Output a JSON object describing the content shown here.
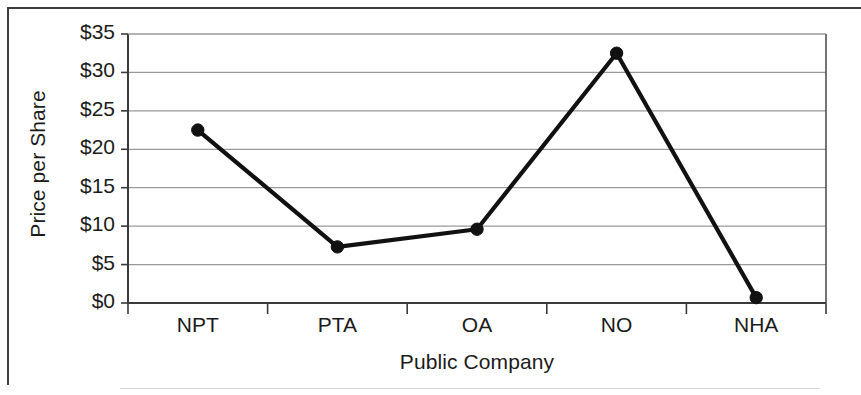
{
  "chart_data": {
    "type": "line",
    "title": "",
    "xlabel": "Public Company",
    "ylabel": "Price per Share",
    "categories": [
      "NPT",
      "PTA",
      "OA",
      "NO",
      "NHA"
    ],
    "values": [
      22.5,
      7.3,
      9.6,
      32.5,
      0.7
    ],
    "series": [
      {
        "name": "Price per Share",
        "values": [
          22.5,
          7.3,
          9.6,
          32.5,
          0.7
        ]
      }
    ],
    "ylim": [
      0,
      35
    ],
    "ytick_step": 5,
    "ytick_labels": [
      "$0",
      "$5",
      "$10",
      "$15",
      "$20",
      "$25",
      "$30",
      "$35"
    ],
    "ytick_values": [
      0,
      5,
      10,
      15,
      20,
      25,
      30,
      35
    ],
    "grid": true,
    "grid_axis": "y",
    "legend": false,
    "legend_position": "none",
    "markers": true,
    "marker_shape": "circle",
    "line_color": "#111111",
    "marker_color": "#111111",
    "grid_color": "#9a9a9a",
    "axis_color": "#3a3a3a",
    "background_color": "#ffffff"
  }
}
